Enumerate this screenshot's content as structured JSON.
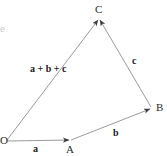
{
  "figure": {
    "background_color": "#ffffff",
    "line_color": "#9a9aa0",
    "arrow_color": "#3a3a3a",
    "label_color": "#1a1a1a",
    "width": 167,
    "height": 156
  },
  "points": {
    "O": {
      "label": "O",
      "x": 7,
      "y": 141
    },
    "A": {
      "label": "A",
      "x": 70,
      "y": 140
    },
    "B": {
      "label": "B",
      "x": 151,
      "y": 108
    },
    "C": {
      "label": "C",
      "x": 99,
      "y": 18
    }
  },
  "vectors": [
    {
      "name": "a",
      "label": "a",
      "from": "O",
      "to": "A"
    },
    {
      "name": "b",
      "label": "b",
      "from": "A",
      "to": "B"
    },
    {
      "name": "c",
      "label": "c",
      "from": "B",
      "to": "C"
    },
    {
      "name": "resultant",
      "label": "a + b + c",
      "from": "O",
      "to": "C"
    }
  ],
  "labels": {
    "a": "a",
    "b": "b",
    "c": "c",
    "sum": "a + b + c",
    "point_O": "O",
    "point_A": "A",
    "point_B": "B",
    "point_C": "C",
    "corner_mark": "e"
  }
}
